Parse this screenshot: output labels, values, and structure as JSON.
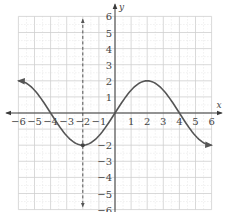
{
  "chart_data": {
    "type": "line",
    "title": "",
    "xlabel": "x",
    "ylabel": "y",
    "xlim": [
      -6,
      6
    ],
    "ylim": [
      -6,
      6
    ],
    "grid": true,
    "x_ticks": [
      -6,
      -5,
      -4,
      -3,
      -2,
      -1,
      1,
      2,
      3,
      4,
      5,
      6
    ],
    "y_ticks": [
      -6,
      -5,
      -4,
      -3,
      -2,
      1,
      2,
      3,
      4,
      5,
      6
    ],
    "x_tick_labels": [
      "−6",
      "−5",
      "−4",
      "−3",
      "−2",
      "−1",
      "1",
      "2",
      "3",
      "4",
      "5",
      "6"
    ],
    "y_tick_labels": [
      "−6",
      "−5",
      "−4",
      "−3",
      "−2",
      "1",
      "2",
      "3",
      "4",
      "5",
      "6"
    ],
    "series": [
      {
        "name": "y = 2 sin(πx/4)",
        "function": "2*sin(pi*x/4)",
        "domain": [
          -6,
          6
        ],
        "points": [
          {
            "x": -6,
            "y": 2
          },
          {
            "x": -4,
            "y": 0
          },
          {
            "x": -2,
            "y": -2
          },
          {
            "x": 0,
            "y": 0
          },
          {
            "x": 2,
            "y": 2
          },
          {
            "x": 4,
            "y": 0
          },
          {
            "x": 6,
            "y": -2
          }
        ],
        "arrows_at_ends": true,
        "color": "#555555"
      }
    ],
    "vertical_lines": [
      {
        "x": -2,
        "style": "dashed",
        "arrows": "both"
      }
    ],
    "marked_points": [
      {
        "x": -2,
        "y": -2
      }
    ]
  }
}
